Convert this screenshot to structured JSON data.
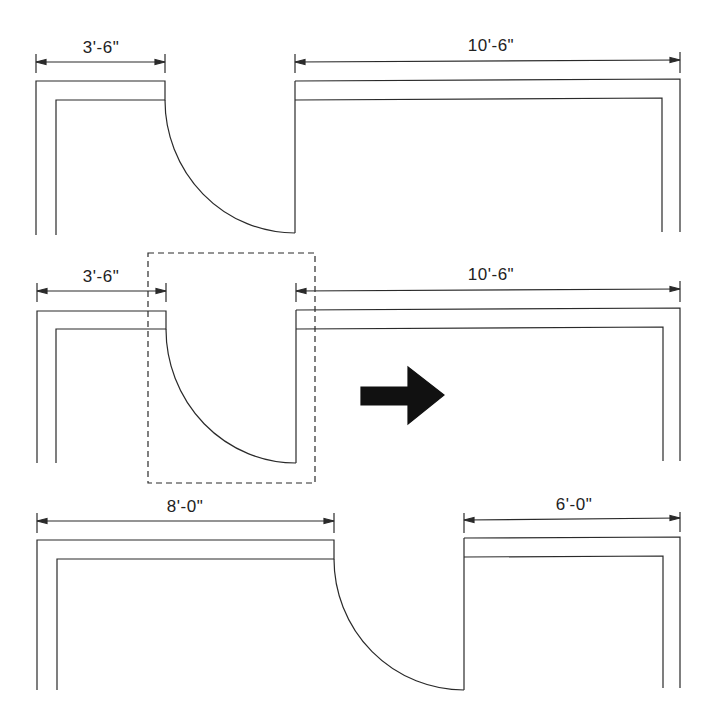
{
  "diagram": {
    "type": "architectural floor plan - door relocation",
    "colors": {
      "line": "#2a2a2a",
      "arrow": "#111111",
      "background": "#ffffff"
    },
    "panels": [
      {
        "id": "original",
        "left_dimension": "3'-6\"",
        "right_dimension": "10'-6\""
      },
      {
        "id": "selected",
        "left_dimension": "3'-6\"",
        "right_dimension": "10'-6\"",
        "selection": "dashed-selection-box",
        "action_icon": "right-arrow-icon"
      },
      {
        "id": "moved",
        "left_dimension": "8'-0\"",
        "right_dimension": "6'-0\""
      }
    ]
  }
}
